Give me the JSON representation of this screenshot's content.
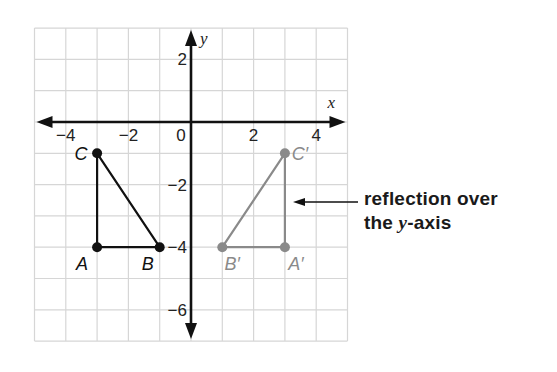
{
  "diagram": {
    "title": "reflection over the y-axis",
    "grid": {
      "x_min": -5,
      "x_max": 5,
      "y_min": -7,
      "y_max": 3,
      "origin_px": [
        191,
        122
      ],
      "unit_px": 31.3,
      "line_color": "#d6d6d6",
      "border_color": "#d0d0d0"
    },
    "axes": {
      "x_label": "x",
      "y_label": "y",
      "color": "#111111",
      "x_ticks": [
        {
          "value": -4,
          "label": "−4"
        },
        {
          "value": -2,
          "label": "−2"
        },
        {
          "value": 0,
          "label": "0"
        },
        {
          "value": 2,
          "label": "2"
        },
        {
          "value": 4,
          "label": "4"
        }
      ],
      "y_ticks": [
        {
          "value": 2,
          "label": "2"
        },
        {
          "value": -2,
          "label": "−2"
        },
        {
          "value": -4,
          "label": "−4"
        },
        {
          "value": -6,
          "label": "−6"
        }
      ]
    },
    "original_triangle": {
      "color": "#111111",
      "vertices": [
        {
          "name": "A",
          "x": -3,
          "y": -4,
          "label": "A"
        },
        {
          "name": "B",
          "x": -1,
          "y": -4,
          "label": "B"
        },
        {
          "name": "C",
          "x": -3,
          "y": -1,
          "label": "C"
        }
      ]
    },
    "image_triangle": {
      "color": "#8a8a8a",
      "vertices": [
        {
          "name": "A'",
          "x": 3,
          "y": -4,
          "label": "A′"
        },
        {
          "name": "B'",
          "x": 1,
          "y": -4,
          "label": "B′"
        },
        {
          "name": "C'",
          "x": 3,
          "y": -1,
          "label": "C′"
        }
      ]
    },
    "annotation": {
      "line1": "reflection over",
      "line2_prefix": "the ",
      "line2_var": "y",
      "line2_suffix": "-axis",
      "arrow_from_px": [
        358,
        202
      ],
      "arrow_to_px": [
        293,
        202
      ]
    }
  }
}
